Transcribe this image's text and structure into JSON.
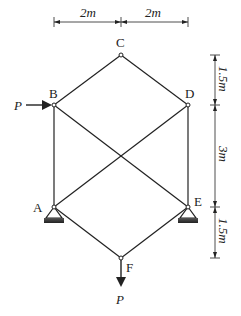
{
  "diagram": {
    "type": "truss",
    "nodes": {
      "A": {
        "label": "A",
        "support": "pin"
      },
      "B": {
        "label": "B"
      },
      "C": {
        "label": "C"
      },
      "D": {
        "label": "D"
      },
      "E": {
        "label": "E",
        "support": "pin"
      },
      "F": {
        "label": "F"
      }
    },
    "members": [
      "C-B",
      "C-D",
      "B-A",
      "D-E",
      "B-E",
      "D-A",
      "A-F",
      "E-F"
    ],
    "loads": [
      {
        "node": "B",
        "direction": "right",
        "label": "P"
      },
      {
        "node": "F",
        "direction": "down",
        "label": "P"
      }
    ],
    "dimensions": {
      "horizontal": [
        "2m",
        "2m"
      ],
      "vertical": [
        "1.5m",
        "3m",
        "1.5m"
      ]
    },
    "colors": {
      "line": "#222222",
      "support": "#333333"
    }
  }
}
